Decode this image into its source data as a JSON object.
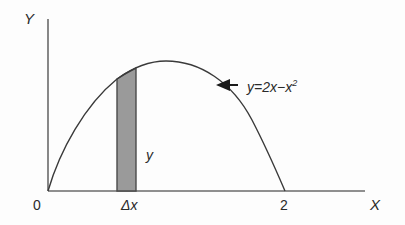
{
  "diagram": {
    "type": "area-under-curve",
    "axes": {
      "y_label": "Y",
      "x_label": "X",
      "origin_label": "0",
      "x_tick_label": "2"
    },
    "curve": {
      "equation_prefix": "y=2x−x",
      "equation_exponent": "2",
      "function": "y = 2x - x^2",
      "x_range": [
        0,
        2
      ]
    },
    "strip": {
      "width_label": "Δx",
      "height_label": "y",
      "fill_color": "#9a9a9a",
      "stroke_color": "#4a4a4a"
    },
    "colors": {
      "axis": "#6a6a6a",
      "curve": "#3a3a3a",
      "arrow": "#1a1a1a",
      "text": "#2a2a2a"
    }
  }
}
